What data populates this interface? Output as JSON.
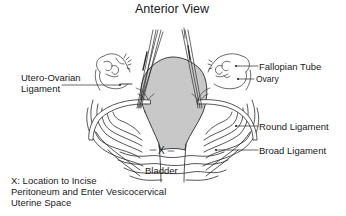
{
  "diagram": {
    "title": "Anterior View",
    "labels": {
      "utero_ovarian_line1": "Utero-Ovarian",
      "utero_ovarian_line2": "Ligament",
      "fallopian_tube": "Fallopian Tube",
      "ovary": "Ovary",
      "round_ligament": "Round Ligament",
      "broad_ligament": "Broad Ligament",
      "bladder": "Bladder",
      "incision_marker": "X"
    },
    "legend": {
      "line1": "X: Location to Incise",
      "line2": "Peritoneum and Enter Vesicocervical",
      "line3": "Uterine Space"
    },
    "colors": {
      "uterus_fill": "#c8c8c8",
      "stroke": "#2a2a2a",
      "background": "#ffffff"
    }
  }
}
